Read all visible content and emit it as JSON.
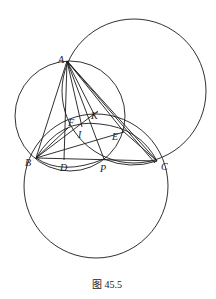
{
  "figure": {
    "caption": "图 45.5",
    "points": {
      "A": {
        "label": "A",
        "x": 67,
        "y": 61
      },
      "B": {
        "label": "B",
        "x": 36,
        "y": 158
      },
      "C": {
        "label": "C",
        "x": 157,
        "y": 161
      },
      "D": {
        "label": "D",
        "x": 64,
        "y": 160
      },
      "P": {
        "label": "P",
        "x": 104,
        "y": 159
      },
      "E": {
        "label": "E",
        "x": 124,
        "y": 132
      },
      "F": {
        "label": "F",
        "x": 68,
        "y": 128
      },
      "I": {
        "label": "I",
        "x": 80,
        "y": 132
      },
      "K": {
        "label": "K",
        "x": 94,
        "y": 114
      }
    },
    "circles": [
      {
        "name": "circle-abp",
        "cx": 70,
        "cy": 116,
        "r": 55
      },
      {
        "name": "circle-upper-right",
        "cx": 134,
        "cy": 91,
        "r": 72
      },
      {
        "name": "circle-lower",
        "cx": 96,
        "cy": 186,
        "r": 72
      },
      {
        "name": "circle-bfec",
        "cx": 96,
        "cy": 176,
        "r": 51
      }
    ]
  }
}
